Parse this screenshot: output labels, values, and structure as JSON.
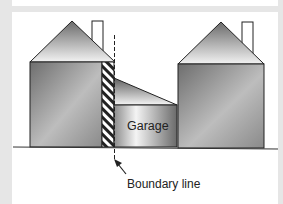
{
  "diagram": {
    "title": "",
    "labels": {
      "garage": "Garage",
      "boundary": "Boundary line"
    },
    "elements": [
      {
        "name": "left-house",
        "parts": [
          "gable-roof",
          "chimney",
          "body",
          "hatched-party-wall"
        ]
      },
      {
        "name": "garage",
        "parts": [
          "lean-to-roof",
          "body"
        ],
        "label": "Garage"
      },
      {
        "name": "right-house",
        "parts": [
          "gable-roof",
          "chimney",
          "body"
        ]
      },
      {
        "name": "boundary-line",
        "style": "dashed",
        "label": "Boundary line",
        "annotation": "arrow pointing to boundary line"
      },
      {
        "name": "ground-line"
      }
    ],
    "colors": {
      "frame": "#e6e6e6",
      "panel": "#ffffff",
      "stroke": "#222222",
      "fill_dark": "#7a7a7a",
      "fill_light": "#f0f0f0"
    }
  }
}
